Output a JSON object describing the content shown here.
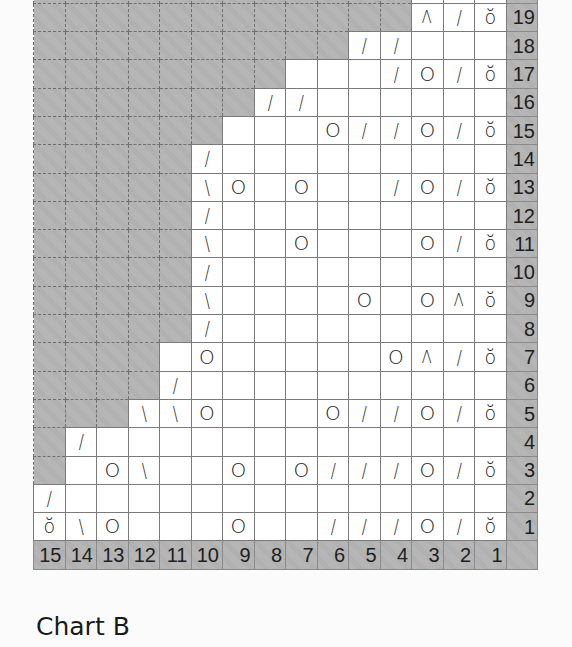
{
  "title": "Chart B",
  "chart_data": {
    "type": "table",
    "title": "Chart B",
    "columns": [
      15,
      14,
      13,
      12,
      11,
      10,
      9,
      8,
      7,
      6,
      5,
      4,
      3,
      2,
      1
    ],
    "column_labels": [
      "15",
      "14",
      "13",
      "12",
      "11",
      "10",
      "9",
      "8",
      "7",
      "6",
      "5",
      "4",
      "3",
      "2",
      "1"
    ],
    "legend_symbols": {
      "/": "k2tog",
      "\\": "ssk",
      "O": "yarn over",
      "Λ": "centered double decrease",
      "ŏ": "twisted/special stitch",
      "G": "no stitch (grey)",
      "": "knit (blank)"
    },
    "rows": [
      {
        "row": 20,
        "label": "",
        "partial": true,
        "cells": [
          "G",
          "G",
          "G",
          "G",
          "G",
          "G",
          "G",
          "G",
          "G",
          "G",
          "G",
          "G",
          "",
          "",
          ""
        ]
      },
      {
        "row": 19,
        "label": "19",
        "cells": [
          "G",
          "G",
          "G",
          "G",
          "G",
          "G",
          "G",
          "G",
          "G",
          "G",
          "G",
          "G",
          "Λ",
          "/",
          "ŏ"
        ]
      },
      {
        "row": 18,
        "label": "18",
        "cells": [
          "G",
          "G",
          "G",
          "G",
          "G",
          "G",
          "G",
          "G",
          "G",
          "G",
          "/",
          "/",
          "",
          "",
          ""
        ]
      },
      {
        "row": 17,
        "label": "17",
        "cells": [
          "G",
          "G",
          "G",
          "G",
          "G",
          "G",
          "G",
          "G",
          "",
          "",
          "",
          "/",
          "O",
          "/",
          "ŏ"
        ]
      },
      {
        "row": 16,
        "label": "16",
        "cells": [
          "G",
          "G",
          "G",
          "G",
          "G",
          "G",
          "G",
          "/",
          "/",
          "",
          "",
          "",
          "",
          "",
          ""
        ]
      },
      {
        "row": 15,
        "label": "15",
        "cells": [
          "G",
          "G",
          "G",
          "G",
          "G",
          "G",
          "",
          "",
          "",
          "O",
          "/",
          "/",
          "O",
          "/",
          "ŏ"
        ]
      },
      {
        "row": 14,
        "label": "14",
        "cells": [
          "G",
          "G",
          "G",
          "G",
          "G",
          "/",
          "",
          "",
          "",
          "",
          "",
          "",
          "",
          "",
          ""
        ]
      },
      {
        "row": 13,
        "label": "13",
        "cells": [
          "G",
          "G",
          "G",
          "G",
          "G",
          "\\",
          "O",
          "",
          "O",
          "",
          "",
          "/",
          "O",
          "/",
          "ŏ"
        ]
      },
      {
        "row": 12,
        "label": "12",
        "cells": [
          "G",
          "G",
          "G",
          "G",
          "G",
          "/",
          "",
          "",
          "",
          "",
          "",
          "",
          "",
          "",
          ""
        ]
      },
      {
        "row": 11,
        "label": "11",
        "cells": [
          "G",
          "G",
          "G",
          "G",
          "G",
          "\\",
          "",
          "",
          "O",
          "",
          "",
          "",
          "O",
          "/",
          "ŏ"
        ]
      },
      {
        "row": 10,
        "label": "10",
        "cells": [
          "G",
          "G",
          "G",
          "G",
          "G",
          "/",
          "",
          "",
          "",
          "",
          "",
          "",
          "",
          "",
          ""
        ]
      },
      {
        "row": 9,
        "label": "9",
        "cells": [
          "G",
          "G",
          "G",
          "G",
          "G",
          "\\",
          "",
          "",
          "",
          "",
          "O",
          "",
          "O",
          "Λ",
          "ŏ"
        ]
      },
      {
        "row": 8,
        "label": "8",
        "cells": [
          "G",
          "G",
          "G",
          "G",
          "G",
          "/",
          "",
          "",
          "",
          "",
          "",
          "",
          "",
          "",
          ""
        ]
      },
      {
        "row": 7,
        "label": "7",
        "cells": [
          "G",
          "G",
          "G",
          "G",
          "",
          "O",
          "",
          "",
          "",
          "",
          "",
          "O",
          "Λ",
          "/",
          "ŏ"
        ]
      },
      {
        "row": 6,
        "label": "6",
        "cells": [
          "G",
          "G",
          "G",
          "G",
          "/",
          "",
          "",
          "",
          "",
          "",
          "",
          "",
          "",
          "",
          ""
        ]
      },
      {
        "row": 5,
        "label": "5",
        "cells": [
          "G",
          "G",
          "G",
          "\\",
          "\\",
          "O",
          "",
          "",
          "",
          "O",
          "/",
          "/",
          "O",
          "/",
          "ŏ"
        ]
      },
      {
        "row": 4,
        "label": "4",
        "cells": [
          "G",
          "/",
          "",
          "",
          "",
          "",
          "",
          "",
          "",
          "",
          "",
          "",
          "",
          "",
          ""
        ]
      },
      {
        "row": 3,
        "label": "3",
        "cells": [
          "G",
          "",
          "O",
          "\\",
          "",
          "",
          "O",
          "",
          "O",
          "/",
          "/",
          "/",
          "O",
          "/",
          "ŏ"
        ]
      },
      {
        "row": 2,
        "label": "2",
        "cells": [
          "/",
          "",
          "",
          "",
          "",
          "",
          "",
          "",
          "",
          "",
          "",
          "",
          "",
          "",
          ""
        ]
      },
      {
        "row": 1,
        "label": "1",
        "cells": [
          "ŏ",
          "\\",
          "O",
          "",
          "",
          "",
          "O",
          "",
          "",
          "/",
          "/",
          "/",
          "O",
          "/",
          "ŏ"
        ]
      }
    ],
    "colors": {
      "no_stitch": "#b3b3b3",
      "stitch": "#ffffff",
      "number_band": "#b3b3b3",
      "gridline": "#7a7a7a",
      "symbol": "#222222"
    }
  }
}
